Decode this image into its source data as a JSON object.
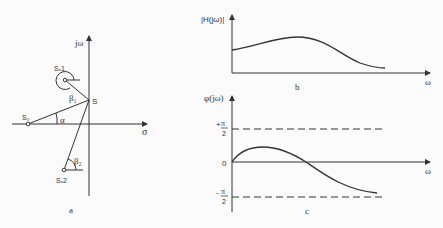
{
  "panel_a": {
    "label": "a",
    "y_axis_label": "jω",
    "x_axis_label": "σ",
    "points": {
      "s": "S",
      "s0": "S₀",
      "sx1": "Sₓ1",
      "sx2": "Sₓ2"
    },
    "angles": {
      "alpha": "α",
      "beta1": "β₁",
      "beta2": "β₂"
    }
  },
  "panel_b": {
    "label": "b",
    "y_axis_label": "|H(jω)|",
    "x_axis_label": "ω"
  },
  "panel_c": {
    "label": "c",
    "y_axis_label": "φ(jω)",
    "x_axis_label": "ω",
    "tick_plus_pi": "π",
    "tick_plus_sign": "+",
    "tick_two": "2",
    "tick_zero": "0",
    "tick_minus_sign": "-",
    "tick_minus_pi": "π"
  }
}
